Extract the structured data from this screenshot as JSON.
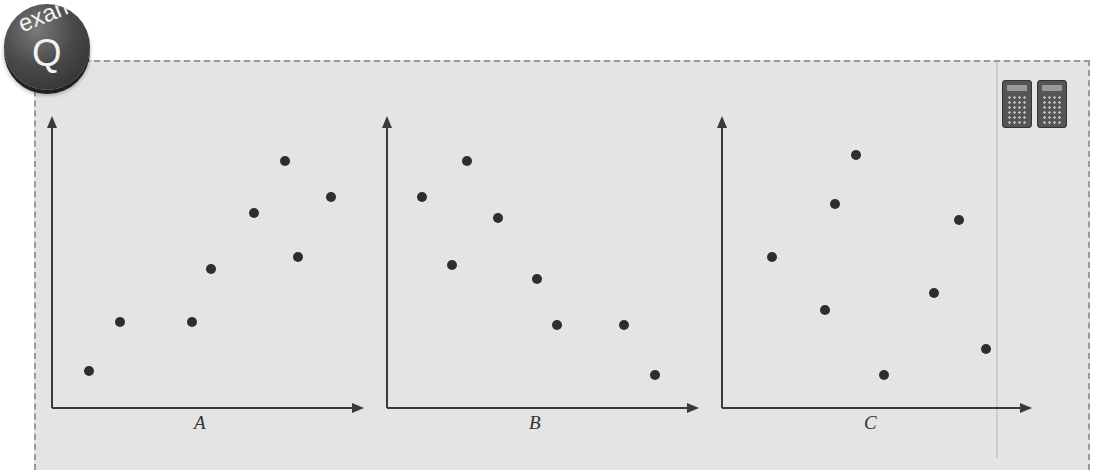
{
  "badge": {
    "top_text": "exam",
    "letter": "Q"
  },
  "icons": [
    "calculator-icon",
    "calculator-icon"
  ],
  "colors": {
    "panel_bg": "#e4e4e4",
    "dot": "#2e2e2e",
    "axis": "#3a3a3a",
    "border": "#9a9a9a"
  },
  "chart_data": [
    {
      "type": "scatter",
      "title": "A",
      "xlabel": "A",
      "ylabel": "",
      "grid": false,
      "trend": "positive correlation",
      "points": [
        [
          1,
          1
        ],
        [
          2,
          2.5
        ],
        [
          4.3,
          2.5
        ],
        [
          4.8,
          4.2
        ],
        [
          6.2,
          5.9
        ],
        [
          7.1,
          7.5
        ],
        [
          7.6,
          4.7
        ],
        [
          8.5,
          6.4
        ]
      ]
    },
    {
      "type": "scatter",
      "title": "B",
      "xlabel": "B",
      "ylabel": "",
      "grid": false,
      "trend": "negative correlation",
      "points": [
        [
          1.1,
          6.4
        ],
        [
          2.5,
          7.5
        ],
        [
          2,
          4.3
        ],
        [
          3.5,
          5.8
        ],
        [
          4.7,
          3.9
        ],
        [
          5.3,
          2.5
        ],
        [
          7.4,
          2.5
        ],
        [
          8.3,
          1
        ]
      ]
    },
    {
      "type": "scatter",
      "title": "C",
      "xlabel": "C",
      "ylabel": "",
      "grid": false,
      "trend": "no correlation",
      "points": [
        [
          1.5,
          4.7
        ],
        [
          3.2,
          3.1
        ],
        [
          3.5,
          6.3
        ],
        [
          4.2,
          7.8
        ],
        [
          5,
          1
        ],
        [
          6.6,
          3.6
        ],
        [
          7.4,
          5.8
        ],
        [
          8.3,
          2
        ]
      ]
    }
  ],
  "pixel_layout": {
    "A": {
      "axis_x": 52,
      "axis_bottom": 408,
      "axis_top": 118,
      "axis_right": 362,
      "label_x": 200,
      "dots": [
        [
          89,
          371
        ],
        [
          120,
          322
        ],
        [
          192,
          322
        ],
        [
          211,
          269
        ],
        [
          254,
          213
        ],
        [
          285,
          161
        ],
        [
          298,
          257
        ],
        [
          331,
          197
        ]
      ]
    },
    "B": {
      "axis_x": 387,
      "axis_bottom": 408,
      "axis_top": 118,
      "axis_right": 697,
      "label_x": 535,
      "dots": [
        [
          422,
          197
        ],
        [
          467,
          161
        ],
        [
          452,
          265
        ],
        [
          498,
          218
        ],
        [
          537,
          279
        ],
        [
          557,
          325
        ],
        [
          624,
          325
        ],
        [
          655,
          375
        ]
      ]
    },
    "C": {
      "axis_x": 722,
      "axis_bottom": 408,
      "axis_top": 118,
      "axis_right": 1030,
      "label_x": 870,
      "dots": [
        [
          772,
          257
        ],
        [
          825,
          310
        ],
        [
          835,
          204
        ],
        [
          856,
          155
        ],
        [
          884,
          375
        ],
        [
          934,
          293
        ],
        [
          959,
          220
        ],
        [
          986,
          349
        ]
      ]
    }
  }
}
